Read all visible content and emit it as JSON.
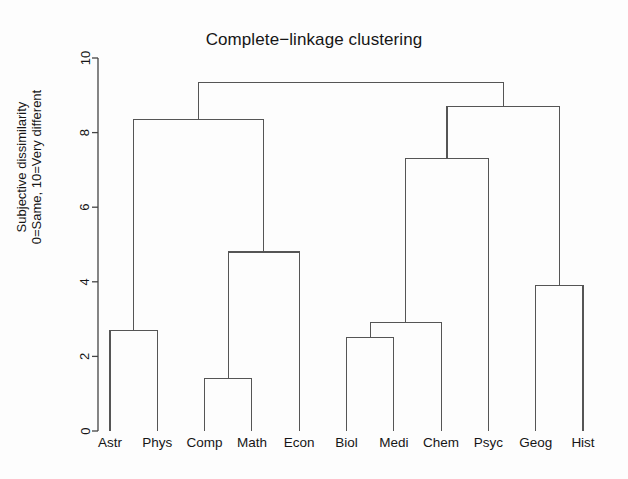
{
  "chart_data": {
    "type": "line",
    "subtype": "dendrogram",
    "title": "Complete−linkage clustering",
    "xlabel": "",
    "ylabel_line1": "Subjective dissimilarity",
    "ylabel_line2": "0=Same, 10=Very different",
    "ylim": [
      0,
      10
    ],
    "yticks": [
      0,
      2,
      4,
      6,
      8,
      10
    ],
    "ytick_labels": [
      "0",
      "2",
      "4",
      "6",
      "8",
      "10"
    ],
    "grid": false,
    "legend": "none",
    "leaf_order": [
      "Astr",
      "Phys",
      "Comp",
      "Math",
      "Econ",
      "Biol",
      "Medi",
      "Chem",
      "Psyc",
      "Geog",
      "Hist"
    ],
    "leaf_labels": {
      "Astr": "Astr",
      "Phys": "Phys",
      "Comp": "Comp",
      "Math": "Math",
      "Econ": "Econ",
      "Biol": "Biol",
      "Medi": "Medi",
      "Chem": "Chem",
      "Psyc": "Psyc",
      "Geog": "Geog",
      "Hist": "Hist"
    },
    "merges": [
      {
        "id": "m1",
        "left": "Comp",
        "right": "Math",
        "height": 1.4
      },
      {
        "id": "m2",
        "left": "Biol",
        "right": "Medi",
        "height": 2.5
      },
      {
        "id": "m3",
        "left": "Astr",
        "right": "Phys",
        "height": 2.7
      },
      {
        "id": "m4",
        "left": "m2",
        "right": "Chem",
        "height": 2.9
      },
      {
        "id": "m5",
        "left": "Geog",
        "right": "Hist",
        "height": 3.9
      },
      {
        "id": "m6",
        "left": "m1",
        "right": "Econ",
        "height": 4.8
      },
      {
        "id": "m7",
        "left": "m4",
        "right": "Psyc",
        "height": 7.3
      },
      {
        "id": "m8",
        "left": "m3",
        "right": "m6",
        "height": 8.35
      },
      {
        "id": "m9",
        "left": "m7",
        "right": "m5",
        "height": 8.7
      },
      {
        "id": "m10",
        "left": "m8",
        "right": "m9",
        "height": 9.35
      }
    ],
    "line_color": "#555555",
    "axis_color": "#444444",
    "background": "#fdfdfd"
  }
}
